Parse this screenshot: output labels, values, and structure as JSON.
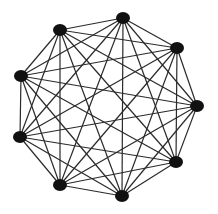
{
  "diagram": {
    "type": "complete-graph",
    "node_count": 9,
    "edge_color": "#2a2a2a",
    "node_color": "#111111",
    "background": "#ffffff",
    "nodes": [
      {
        "id": "n1",
        "x": 123,
        "y": 18
      },
      {
        "id": "n2",
        "x": 177,
        "y": 48
      },
      {
        "id": "n3",
        "x": 197,
        "y": 106
      },
      {
        "id": "n4",
        "x": 176,
        "y": 162
      },
      {
        "id": "n5",
        "x": 122,
        "y": 196
      },
      {
        "id": "n6",
        "x": 60,
        "y": 185
      },
      {
        "id": "n7",
        "x": 20,
        "y": 137
      },
      {
        "id": "n8",
        "x": 21,
        "y": 76
      },
      {
        "id": "n9",
        "x": 60,
        "y": 30
      }
    ]
  }
}
